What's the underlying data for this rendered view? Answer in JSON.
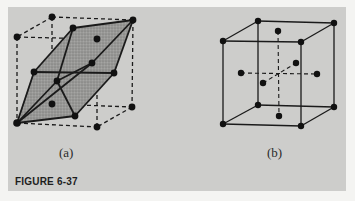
{
  "figure": {
    "caption": "FIGURE 6-37",
    "panels": [
      {
        "id": "a",
        "label": "(a)",
        "description": "Cube (dashed edges) with inscribed rhombohedral primitive cell (shaded, solid edges) connecting corner and face-center atoms",
        "nodes": {
          "c_btl": [
            52,
            17
          ],
          "c_btr": [
            133,
            20
          ],
          "c_ftl": [
            17,
            37
          ],
          "c_ftr": [
            97,
            39
          ],
          "c_bbl": [
            52,
            104
          ],
          "c_bbr": [
            132,
            107
          ],
          "c_fbl": [
            17,
            123
          ],
          "c_fbr": [
            97,
            127
          ],
          "f_top": [
            73,
            28
          ],
          "f_left": [
            34,
            72
          ],
          "f_back": [
            92,
            63
          ],
          "f_front": [
            57,
            81
          ],
          "f_right": [
            114,
            73
          ],
          "f_bottom": [
            75,
            116
          ]
        }
      },
      {
        "id": "b",
        "label": "(b)",
        "description": "Face-centered cubic unit cell with atoms at corners and face centers",
        "nodes": {
          "c_btl": [
            258,
            21
          ],
          "c_btr": [
            334,
            23
          ],
          "c_ftl": [
            223,
            41
          ],
          "c_ftr": [
            301,
            42
          ],
          "c_bbl": [
            258,
            105
          ],
          "c_bbr": [
            334,
            107
          ],
          "c_fbl": [
            223,
            124
          ],
          "c_fbr": [
            301,
            126
          ],
          "f_top": [
            278,
            31
          ],
          "f_left": [
            241,
            73
          ],
          "f_right": [
            317,
            74
          ],
          "f_back": [
            296,
            63
          ],
          "f_front": [
            263,
            83
          ],
          "f_bottom": [
            279,
            116
          ]
        }
      }
    ],
    "colors": {
      "panel_bg": "#cdcdcb",
      "page_bg": "#f4f4f2",
      "line": "#1a1a1a",
      "shade": "#8f8f8d"
    }
  }
}
